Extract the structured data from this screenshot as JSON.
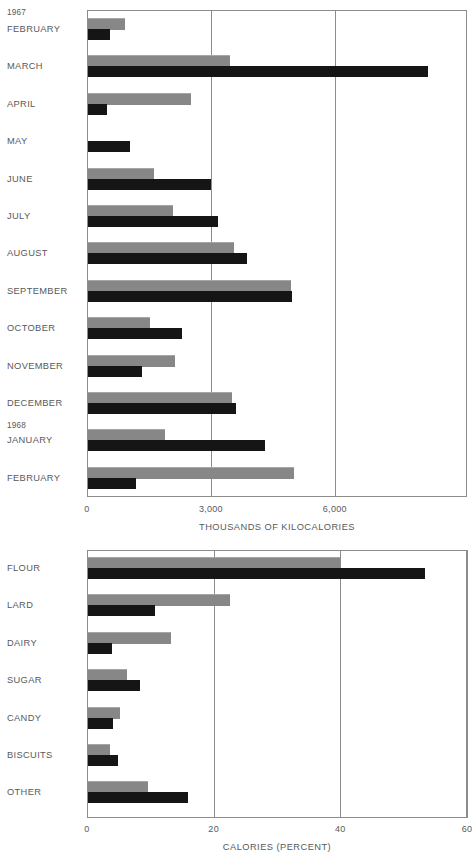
{
  "chart_data": [
    {
      "type": "bar",
      "orientation": "horizontal",
      "title": "",
      "xlabel": "THOUSANDS OF KILOCALORIES",
      "ylabel": "",
      "xlim": [
        0,
        9200
      ],
      "xticks": [
        0,
        3000,
        6000
      ],
      "xticklabels": [
        "0",
        "3,000",
        "6,000"
      ],
      "grid": true,
      "legend": "none",
      "year_markers": [
        {
          "label": "1967",
          "before_category": "FEBRUARY"
        },
        {
          "label": "1968",
          "before_category": "JANUARY"
        }
      ],
      "categories": [
        "FEBRUARY",
        "MARCH",
        "APRIL",
        "MAY",
        "JUNE",
        "JULY",
        "AUGUST",
        "SEPTEMBER",
        "OCTOBER",
        "NOVEMBER",
        "DECEMBER",
        "JANUARY",
        "FEBRUARY"
      ],
      "series": [
        {
          "name": "gray",
          "values": [
            930,
            3450,
            2520,
            0,
            1620,
            2080,
            3570,
            4950,
            1520,
            2130,
            3500,
            1890,
            5000
          ]
        },
        {
          "name": "black",
          "values": [
            560,
            8250,
            490,
            1050,
            2990,
            3160,
            3870,
            4970,
            2300,
            1320,
            3600,
            4310,
            1180
          ]
        }
      ]
    },
    {
      "type": "bar",
      "orientation": "horizontal",
      "title": "",
      "xlabel": "CALORIES  (PERCENT)",
      "ylabel": "",
      "xlim": [
        0,
        60
      ],
      "xticks": [
        0,
        20,
        40,
        60
      ],
      "xticklabels": [
        "0",
        "20",
        "40",
        "60"
      ],
      "grid": true,
      "legend": "none",
      "categories": [
        "FLOUR",
        "LARD",
        "DAIRY",
        "SUGAR",
        "CANDY",
        "BISCUITS",
        "OTHER"
      ],
      "series": [
        {
          "name": "gray",
          "values": [
            40.0,
            22.5,
            13.3,
            6.3,
            5.2,
            3.6,
            9.7
          ]
        },
        {
          "name": "black",
          "values": [
            53.3,
            10.8,
            4.0,
            8.4,
            4.1,
            4.9,
            15.9
          ]
        }
      ]
    }
  ],
  "top_chart": {
    "year_1967": "1967",
    "year_1968": "1968",
    "rows": [
      {
        "label": "FEBRUARY"
      },
      {
        "label": "MARCH"
      },
      {
        "label": "APRIL"
      },
      {
        "label": "MAY"
      },
      {
        "label": "JUNE"
      },
      {
        "label": "JULY"
      },
      {
        "label": "AUGUST"
      },
      {
        "label": "SEPTEMBER"
      },
      {
        "label": "OCTOBER"
      },
      {
        "label": "NOVEMBER"
      },
      {
        "label": "DECEMBER"
      },
      {
        "label": "JANUARY"
      },
      {
        "label": "FEBRUARY"
      }
    ],
    "ticks": [
      "0",
      "3,000",
      "6,000"
    ],
    "axis_title": "THOUSANDS OF KILOCALORIES"
  },
  "bottom_chart": {
    "rows": [
      {
        "label": "FLOUR"
      },
      {
        "label": "LARD"
      },
      {
        "label": "DAIRY"
      },
      {
        "label": "SUGAR"
      },
      {
        "label": "CANDY"
      },
      {
        "label": "BISCUITS"
      },
      {
        "label": "OTHER"
      }
    ],
    "ticks": [
      "0",
      "20",
      "40",
      "60"
    ],
    "axis_title": "CALORIES  (PERCENT)"
  },
  "colors": {
    "gray_bar": "#878787",
    "black_bar": "#151515",
    "axis": "#8c8c8c",
    "text": "#58595b"
  }
}
